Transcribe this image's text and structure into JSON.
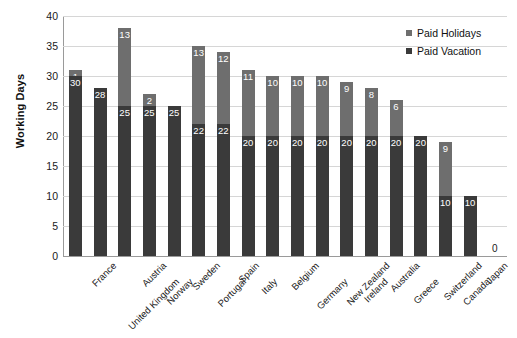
{
  "chart_data": {
    "type": "bar",
    "subtype": "stacked-bar",
    "title": "",
    "xlabel": "",
    "ylabel": "Working Days",
    "ylim": [
      0,
      40
    ],
    "ytick_step": 5,
    "yticks": [
      0,
      5,
      10,
      15,
      20,
      25,
      30,
      35,
      40
    ],
    "grid": true,
    "legend_position": "top-right",
    "categories": [
      "France",
      "United Kingdom",
      "Austria",
      "Norway",
      "Sweden",
      "Portugal",
      "Spain",
      "Italy",
      "Belgium",
      "Germany",
      "New Zealand",
      "Ireland",
      "Australia",
      "Greece",
      "Switzerland",
      "Canada",
      "Japan",
      "United States"
    ],
    "series": [
      {
        "name": "Paid Vacation",
        "color": "#3a3a3a",
        "values": [
          30,
          28,
          25,
          25,
          25,
          22,
          22,
          20,
          20,
          20,
          20,
          20,
          20,
          20,
          20,
          10,
          10,
          0
        ]
      },
      {
        "name": "Paid Holidays",
        "color": "#6e6e6e",
        "values": [
          1,
          0,
          13,
          2,
          0,
          13,
          12,
          11,
          10,
          10,
          10,
          9,
          8,
          6,
          0,
          9,
          0,
          0
        ]
      }
    ],
    "totals": [
      31,
      28,
      38,
      27,
      25,
      35,
      34,
      31,
      30,
      30,
      30,
      29,
      28,
      26,
      20,
      19,
      10,
      0
    ],
    "zero_annotation": "0"
  },
  "legend": {
    "items": [
      {
        "label": "Paid Holidays",
        "color": "#6e6e6e",
        "swatch": "square-marker-icon"
      },
      {
        "label": "Paid Vacation",
        "color": "#3a3a3a",
        "swatch": "square-marker-icon"
      }
    ]
  },
  "axes": {
    "y_title": "Working Days"
  },
  "colors": {
    "paid_vacation": "#3a3a3a",
    "paid_holidays": "#6e6e6e",
    "gridline": "#d6d6d6",
    "axis": "#9a9a9a",
    "background": "#ffffff",
    "text": "#1a1a1a"
  }
}
